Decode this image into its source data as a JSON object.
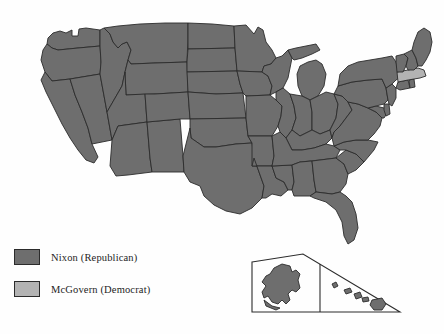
{
  "map": {
    "title": "United States presidential election results map",
    "colors": {
      "republican_fill": "#6e6e6e",
      "democrat_fill": "#b3b3b3",
      "border": "#2b2b2b",
      "background": "#fefefe"
    },
    "default_party": "republican",
    "states": [
      {
        "code": "WA",
        "name": "Washington",
        "party": "republican"
      },
      {
        "code": "OR",
        "name": "Oregon",
        "party": "republican"
      },
      {
        "code": "CA",
        "name": "California",
        "party": "republican"
      },
      {
        "code": "NV",
        "name": "Nevada",
        "party": "republican"
      },
      {
        "code": "ID",
        "name": "Idaho",
        "party": "republican"
      },
      {
        "code": "MT",
        "name": "Montana",
        "party": "republican"
      },
      {
        "code": "WY",
        "name": "Wyoming",
        "party": "republican"
      },
      {
        "code": "UT",
        "name": "Utah",
        "party": "republican"
      },
      {
        "code": "AZ",
        "name": "Arizona",
        "party": "republican"
      },
      {
        "code": "NM",
        "name": "New Mexico",
        "party": "republican"
      },
      {
        "code": "CO",
        "name": "Colorado",
        "party": "republican"
      },
      {
        "code": "ND",
        "name": "North Dakota",
        "party": "republican"
      },
      {
        "code": "SD",
        "name": "South Dakota",
        "party": "republican"
      },
      {
        "code": "NE",
        "name": "Nebraska",
        "party": "republican"
      },
      {
        "code": "KS",
        "name": "Kansas",
        "party": "republican"
      },
      {
        "code": "OK",
        "name": "Oklahoma",
        "party": "republican"
      },
      {
        "code": "TX",
        "name": "Texas",
        "party": "republican"
      },
      {
        "code": "MN",
        "name": "Minnesota",
        "party": "republican"
      },
      {
        "code": "IA",
        "name": "Iowa",
        "party": "republican"
      },
      {
        "code": "MO",
        "name": "Missouri",
        "party": "republican"
      },
      {
        "code": "AR",
        "name": "Arkansas",
        "party": "republican"
      },
      {
        "code": "LA",
        "name": "Louisiana",
        "party": "republican"
      },
      {
        "code": "WI",
        "name": "Wisconsin",
        "party": "republican"
      },
      {
        "code": "IL",
        "name": "Illinois",
        "party": "republican"
      },
      {
        "code": "MS",
        "name": "Mississippi",
        "party": "republican"
      },
      {
        "code": "MI",
        "name": "Michigan",
        "party": "republican"
      },
      {
        "code": "IN",
        "name": "Indiana",
        "party": "republican"
      },
      {
        "code": "KY",
        "name": "Kentucky",
        "party": "republican"
      },
      {
        "code": "TN",
        "name": "Tennessee",
        "party": "republican"
      },
      {
        "code": "AL",
        "name": "Alabama",
        "party": "republican"
      },
      {
        "code": "OH",
        "name": "Ohio",
        "party": "republican"
      },
      {
        "code": "WV",
        "name": "West Virginia",
        "party": "republican"
      },
      {
        "code": "GA",
        "name": "Georgia",
        "party": "republican"
      },
      {
        "code": "FL",
        "name": "Florida",
        "party": "republican"
      },
      {
        "code": "SC",
        "name": "South Carolina",
        "party": "republican"
      },
      {
        "code": "NC",
        "name": "North Carolina",
        "party": "republican"
      },
      {
        "code": "VA",
        "name": "Virginia",
        "party": "republican"
      },
      {
        "code": "MD",
        "name": "Maryland",
        "party": "republican"
      },
      {
        "code": "DE",
        "name": "Delaware",
        "party": "republican"
      },
      {
        "code": "PA",
        "name": "Pennsylvania",
        "party": "republican"
      },
      {
        "code": "NJ",
        "name": "New Jersey",
        "party": "republican"
      },
      {
        "code": "NY",
        "name": "New York",
        "party": "republican"
      },
      {
        "code": "CT",
        "name": "Connecticut",
        "party": "republican"
      },
      {
        "code": "RI",
        "name": "Rhode Island",
        "party": "republican"
      },
      {
        "code": "MA",
        "name": "Massachusetts",
        "party": "democrat"
      },
      {
        "code": "VT",
        "name": "Vermont",
        "party": "republican"
      },
      {
        "code": "NH",
        "name": "New Hampshire",
        "party": "republican"
      },
      {
        "code": "ME",
        "name": "Maine",
        "party": "republican"
      },
      {
        "code": "AK",
        "name": "Alaska",
        "party": "republican"
      },
      {
        "code": "HI",
        "name": "Hawaii",
        "party": "republican"
      }
    ],
    "inset": {
      "name": "alaska-hawaii-inset",
      "regions": [
        "Alaska",
        "Hawaii"
      ]
    }
  },
  "legend": {
    "items": [
      {
        "label": "Nixon (Republican)",
        "party": "republican",
        "color": "#6e6e6e"
      },
      {
        "label": "McGovern (Democrat)",
        "party": "democrat",
        "color": "#b3b3b3"
      }
    ]
  }
}
